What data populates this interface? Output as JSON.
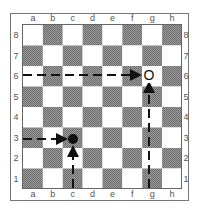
{
  "diagram": {
    "type": "chessboard",
    "files": [
      "a",
      "b",
      "c",
      "d",
      "e",
      "f",
      "g",
      "h"
    ],
    "ranks": [
      "8",
      "7",
      "6",
      "5",
      "4",
      "3",
      "2",
      "1"
    ],
    "colors": {
      "light_square": "#ffffff",
      "dark_square": "#8a8a8a",
      "frame": "#777777",
      "line": "#111111"
    },
    "pieces": [
      {
        "square": "g6",
        "symbol": "O",
        "kind": "hollow-circle-marker"
      },
      {
        "square": "c3",
        "symbol": "●",
        "kind": "filled-circle-marker"
      }
    ],
    "arrows": [
      {
        "name": "rank-6-arrow",
        "from": "a6 edge",
        "to": "g6",
        "style": "dashed",
        "direction": "horizontal"
      },
      {
        "name": "g-file-arrow",
        "from": "g1 edge",
        "to": "g6",
        "style": "dashed",
        "direction": "vertical"
      },
      {
        "name": "rank-3-arrow",
        "from": "a3 edge",
        "to": "c3",
        "style": "dashed",
        "direction": "horizontal"
      },
      {
        "name": "c-file-arrow",
        "from": "c1 edge",
        "to": "c3",
        "style": "dashed",
        "direction": "vertical"
      }
    ]
  }
}
